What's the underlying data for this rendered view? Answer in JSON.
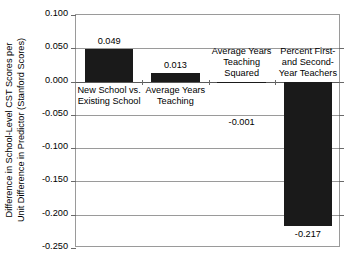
{
  "chart_data": {
    "type": "bar",
    "title": "",
    "xlabel": "",
    "ylabel_line1": "Difference in School-Level CST Scores per",
    "ylabel_line2": "Unit Difference in Predictor (Stanford Scores)",
    "ylim": [
      -0.25,
      0.1
    ],
    "yticks": [
      "0.100",
      "0.050",
      "0.000",
      "-0.050",
      "-0.100",
      "-0.150",
      "-0.200",
      "-0.250"
    ],
    "ytick_values": [
      0.1,
      0.05,
      0.0,
      -0.05,
      -0.1,
      -0.15,
      -0.2,
      -0.25
    ],
    "grid": true,
    "legend": "none",
    "bar_color": "#1a1a1a",
    "categories": [
      "New School vs. Existing School",
      "Average Years Teaching",
      "Average Years Teaching Squared",
      "Percent First- and Second-Year Teachers"
    ],
    "values": [
      0.049,
      0.013,
      -0.001,
      -0.217
    ],
    "value_labels": [
      "0.049",
      "0.013",
      "-0.001",
      "-0.217"
    ],
    "bars": [
      {
        "category_lines": [
          "New School vs.",
          "Existing School"
        ],
        "value": 0.049,
        "value_label": "0.049"
      },
      {
        "category_lines": [
          "Average Years",
          "Teaching"
        ],
        "value": 0.013,
        "value_label": "0.013"
      },
      {
        "category_lines": [
          "Average Years",
          "Teaching",
          "Squared"
        ],
        "value": -0.001,
        "value_label": "-0.001"
      },
      {
        "category_lines": [
          "Percent First-",
          "and Second-",
          "Year Teachers"
        ],
        "value": -0.217,
        "value_label": "-0.217"
      }
    ]
  }
}
